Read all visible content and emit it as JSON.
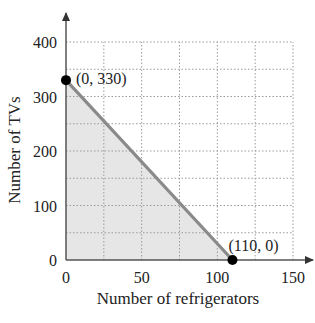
{
  "chart_data": {
    "type": "area",
    "title": "",
    "xlabel": "Number of refrigerators",
    "ylabel": "Number of TVs",
    "xlim": [
      0,
      150
    ],
    "ylim": [
      0,
      400
    ],
    "x_ticks": [
      0,
      50,
      100,
      150
    ],
    "y_ticks": [
      0,
      100,
      200,
      300,
      400
    ],
    "x_ticks_labels": [
      "0",
      "50",
      "100",
      "150"
    ],
    "y_ticks_labels": [
      "0",
      "100",
      "200",
      "300",
      "400"
    ],
    "grid": true,
    "grid_x_step": 25,
    "grid_y_step": 50,
    "grid_style": "dotted",
    "legend": null,
    "series": [
      {
        "name": "constraint line",
        "x": [
          0,
          110
        ],
        "y": [
          330,
          0
        ],
        "color": "#8a8a8a",
        "fill": "#e6e6e6",
        "fill_region": "below line, above x-axis, right of y-axis"
      }
    ],
    "points": [
      {
        "x": 0,
        "y": 330,
        "label": "(0, 330)"
      },
      {
        "x": 110,
        "y": 0,
        "label": "(110, 0)"
      }
    ]
  },
  "colors": {
    "line": "#8a8a8a",
    "fill": "#e6e6e6",
    "grid": "#9a9a9a",
    "axis": "#555555",
    "point": "#000000",
    "text": "#222222"
  }
}
